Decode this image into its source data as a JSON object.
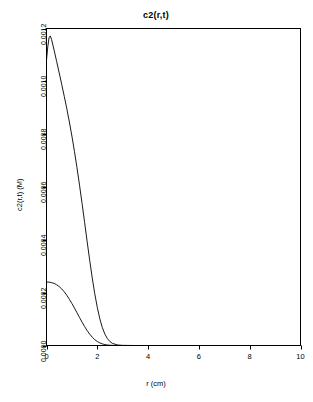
{
  "chart_data": {
    "type": "line",
    "title": "c2(r,t)",
    "xlabel": "r (cm)",
    "ylabel": "c2(r,t) (M)",
    "xlim": [
      0,
      10
    ],
    "ylim": [
      0,
      0.0012
    ],
    "xticks": [
      "0",
      "2",
      "4",
      "6",
      "8",
      "10"
    ],
    "xtick_values": [
      0,
      2,
      4,
      6,
      8,
      10
    ],
    "yticks": [
      "0.0000",
      "0.0002",
      "0.0004",
      "0.0006",
      "0.0008",
      "0.0010",
      "0.0012"
    ],
    "ytick_values": [
      0.0,
      0.0002,
      0.0004,
      0.0006,
      0.0008,
      0.001,
      0.0012
    ],
    "grid": false,
    "legend": "none",
    "line_color": "#000000",
    "background": "#ffffff",
    "frame_color": "#000000",
    "series": [
      {
        "name": "peaked-profile",
        "x": [
          0.0,
          0.05,
          0.1,
          0.15,
          0.2,
          0.3,
          0.4,
          0.5,
          0.6,
          0.7,
          0.8,
          0.9,
          1.0,
          1.1,
          1.2,
          1.3,
          1.4,
          1.5,
          1.6,
          1.7,
          1.8,
          1.9,
          2.0,
          2.1,
          2.2,
          2.3,
          2.4,
          2.5,
          2.6,
          2.8,
          3.0,
          3.5,
          4.0,
          5.0,
          6.0,
          8.0,
          10.0
        ],
        "values": [
          0.00108,
          0.00113,
          0.001165,
          0.001172,
          0.001158,
          0.001118,
          0.001075,
          0.001032,
          0.000988,
          0.000943,
          0.000896,
          0.000846,
          0.000793,
          0.000735,
          0.000673,
          0.000607,
          0.000538,
          0.000466,
          0.000394,
          0.000323,
          0.000256,
          0.000196,
          0.000144,
          0.000101,
          6.75e-05,
          4.28e-05,
          2.57e-05,
          1.46e-05,
          7.9e-06,
          2e-06,
          5e-07,
          0.0,
          0.0,
          0.0,
          0.0,
          0.0,
          0.0
        ]
      },
      {
        "name": "low-profile",
        "x": [
          0.0,
          0.1,
          0.2,
          0.3,
          0.4,
          0.5,
          0.6,
          0.7,
          0.8,
          0.9,
          1.0,
          1.1,
          1.2,
          1.3,
          1.4,
          1.5,
          1.6,
          1.7,
          1.8,
          1.9,
          2.0,
          2.1,
          2.2,
          2.3,
          2.4,
          2.5,
          2.6,
          2.8,
          3.0,
          3.5,
          4.0,
          5.0,
          6.0,
          8.0,
          10.0
        ],
        "values": [
          0.00024,
          0.00024,
          0.000238,
          0.000235,
          0.00023,
          0.000223,
          0.000214,
          0.000203,
          0.00019,
          0.000175,
          0.000159,
          0.000142,
          0.000124,
          0.000106,
          8.85e-05,
          7.18e-05,
          5.65e-05,
          4.3e-05,
          3.15e-05,
          2.22e-05,
          1.5e-05,
          9.7e-06,
          6e-06,
          3.5e-06,
          1.9e-06,
          1e-06,
          5e-07,
          1e-07,
          0.0,
          0.0,
          0.0,
          0.0,
          0.0,
          0.0,
          0.0
        ]
      },
      {
        "name": "baseline-zero",
        "x": [
          0.0,
          10.0
        ],
        "values": [
          0.0,
          0.0
        ]
      }
    ]
  }
}
